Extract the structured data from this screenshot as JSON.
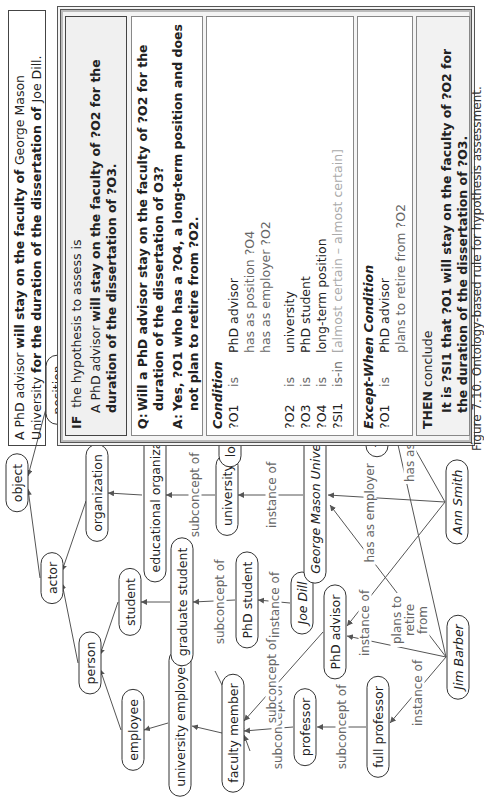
{
  "header": {
    "part1": "A PhD advisor ",
    "part2": "will stay on the faculty of ",
    "part3": "George Mason University ",
    "part4": "for the duration of the dissertation of ",
    "part5": "Joe Dill."
  },
  "rule": {
    "if_keyword": "IF",
    "if_text": "the hypothesis to assess is",
    "hypothesis_a": "A PhD advisor ",
    "hypothesis_b": "will stay on the faculty of ?O2 for the duration of the dissertation of ?O3.",
    "q_label": "Q:",
    "q_text": "Will a PhD advisor stay on the faculty of ?O2 for the duration of the dissertation of O3?",
    "a_label": "A:",
    "a_text": "Yes, ?O1 who has a ?O4, a long-term position and does not plan to retire from ?O2.",
    "condition_title": "Condition",
    "condition_rows": [
      {
        "var": "?O1",
        "rel": "is",
        "val": "PhD advisor"
      },
      {
        "var": "",
        "rel": "",
        "val": "has as position   ?O4"
      },
      {
        "var": "",
        "rel": "",
        "val": "has as employer ?O2"
      },
      {
        "var": "?O2",
        "rel": "is",
        "val": "university"
      },
      {
        "var": "?O3",
        "rel": "is",
        "val": "PhD student"
      },
      {
        "var": "?O4",
        "rel": "is",
        "val": "long-term position"
      },
      {
        "var": "?SI1",
        "rel": "is-in",
        "val": "[almost certain – almost certain]"
      }
    ],
    "except_title": "Except-When Condition",
    "except_rows": [
      {
        "var": "?O1",
        "rel": "is",
        "val": "PhD advisor"
      },
      {
        "var": "",
        "rel": "",
        "val": "plans to retire from    ?O2"
      }
    ],
    "then_keyword": "THEN",
    "then_text": "conclude",
    "conclusion": "It is ?SI1 that ?O1 will stay on the faculty of ?O2 for the duration of the dissertation of ?O3."
  },
  "ontology": {
    "nodes": {
      "object": "object",
      "actor": "actor",
      "position": "position",
      "person": "person",
      "organization": "organization",
      "employee": "employee",
      "student": "student",
      "educational_organization": "educational organization",
      "university_employee": "university employee",
      "graduate_student": "graduate student",
      "faculty_member": "faculty member",
      "phd_student": "PhD student",
      "university": "university",
      "long_term_position": "long-term position",
      "professor": "professor",
      "phd_advisor": "PhD advisor",
      "joe_dill": "Joe Dill",
      "george_mason_university": "George Mason University",
      "tenure_position": "tenure position",
      "full_professor": "full professor",
      "jim_barber": "Jim Barber",
      "ann_smith": "Ann Smith"
    },
    "edge_labels": {
      "subconcept_of": "subconcept of",
      "instance_of": "instance of",
      "has_as_employer": "has as employer",
      "has_as_position": "has as position",
      "plans_to_retire_from": "plans to retire from"
    }
  },
  "caption": "Figure 7.10. Ontology-based rule for hypothesis assessment."
}
